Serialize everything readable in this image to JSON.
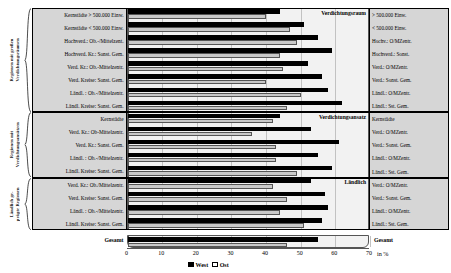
{
  "chart_data": {
    "type": "bar",
    "orientation": "horizontal",
    "title": "",
    "xlabel": "in %",
    "ylabel": "",
    "xlim": [
      0,
      70
    ],
    "xticks": [
      0,
      10,
      20,
      30,
      40,
      50,
      60,
      70
    ],
    "grid": true,
    "legend_position": "bottom",
    "series": [
      {
        "name": "West",
        "color": "#000000"
      },
      {
        "name": "Ost",
        "color": "#c9c9c9"
      }
    ],
    "groups": [
      {
        "side_label": "Regionen mit großen\nVerdichtungsräumen",
        "band_caption": "Verdichtungsraum",
        "categories": [
          "Kernstädte > 500.000 Einw.",
          "Kernstädte < 500.000 Einw.",
          "Hochverd.: Ob.-/Mittelzent.",
          "Hochverd. Kr.: Sonst. Gem.",
          "Verd. Kr.: Ob.-Mittelzentr.",
          "Verd. Kreise: Sonst. Gem.",
          "Ländl. : Ob.-/Mittelzentr.",
          "Ländl. Kreise: Sonst. Gem."
        ],
        "short_labels": [
          "> 500.000 Einw.",
          "< 500.000 Einw.",
          "Hochv.: O/MZentr.",
          "Hochverd.: Sonst.",
          "Verd.: O/MZentr.",
          "Verd.: Sonst. Gem.",
          "Ländl.: O/MZentr.",
          "Ländl.: Sst. Gem."
        ],
        "west": [
          44,
          51,
          55,
          59,
          52,
          56,
          58,
          62
        ],
        "ost": [
          40,
          47,
          49,
          44,
          45,
          40,
          50,
          46
        ]
      },
      {
        "side_label": "Regionen mit\nVerdichtungsansätzen",
        "band_caption": "Verdichtungsansatz",
        "categories": [
          "Kernstädte",
          "Verd. Kr.: Ob-Mittelzentr.",
          "Verd. Kr.: Sonst. Gem.",
          "Ländl. : Ob.-/Mittelzentr.",
          "Ländl. Kreise: Sonst. Gem."
        ],
        "short_labels": [
          "Kernstädte",
          "Verd.: O/MZentr.",
          "Verd.: Sonst. Gem.",
          "Ländl.: O/MZentr.",
          "Ländl.: Sst. Gem."
        ],
        "west": [
          44,
          53,
          61,
          55,
          59
        ],
        "ost": [
          42,
          36,
          43,
          43,
          49
        ]
      },
      {
        "side_label": "Ländlich ge-\nprägte Regionen",
        "band_caption": "Ländlich",
        "categories": [
          "Verd. Kr.: Ob./Mittelzentr.",
          "Verd. Kreise: Sonst. Gem.",
          "Ländl. : Ob.-/Mittelzentr.",
          "Ländl. Kreise: Sonst. Gem."
        ],
        "short_labels": [
          "Verd.: O/MZentr.",
          "Verd.: Sonst. Gem.",
          "Ländl.: O/MZentr.",
          "Ländl.: Sst. Gem."
        ],
        "west": [
          53,
          57,
          58,
          56
        ],
        "ost": [
          42,
          46,
          44,
          51
        ]
      }
    ],
    "total": {
      "label": "Gesamt",
      "right_label": "Gesamt",
      "west": 55,
      "ost": 46
    }
  }
}
